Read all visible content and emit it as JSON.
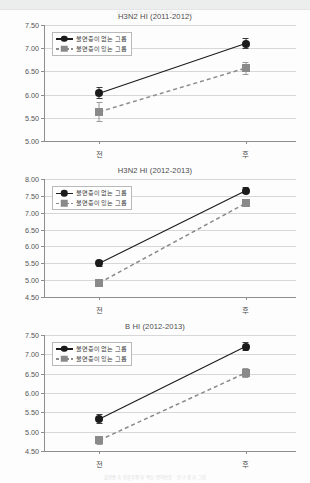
{
  "page": {
    "header_ghost_text": "대한수면의학회지 제21권 제2호 2014",
    "footer_ghost_text": "불면증과 인플루엔자 백신 면역반응  ·  연구 결과 그림"
  },
  "legend": {
    "series": [
      {
        "label": "불면증이 없는 그룹",
        "marker": "circle",
        "line": "solid",
        "color": "#1b1b1b"
      },
      {
        "label": "불면증이 있는 그룹",
        "marker": "square",
        "line": "dashed",
        "color": "#8a8a8a"
      }
    ]
  },
  "chart_data": [
    {
      "type": "line",
      "title": "H3N2 HI (2011-2012)",
      "xlabel": "",
      "ylabel": "",
      "categories": [
        "전",
        "후"
      ],
      "ylim": [
        5.0,
        7.5
      ],
      "yticks": [
        "5.00",
        "5.50",
        "6.00",
        "6.50",
        "7.00",
        "7.50"
      ],
      "grid": true,
      "legend_position": "top-left",
      "series": [
        {
          "name": "불면증이 없는 그룹",
          "values": [
            6.03,
            7.1
          ],
          "errors": [
            0.13,
            0.11
          ]
        },
        {
          "name": "불면증이 있는 그룹",
          "values": [
            5.63,
            6.57
          ],
          "errors": [
            0.22,
            0.14
          ]
        }
      ]
    },
    {
      "type": "line",
      "title": "H3N2 HI (2012-2013)",
      "xlabel": "",
      "ylabel": "",
      "categories": [
        "전",
        "후"
      ],
      "ylim": [
        4.5,
        8.0
      ],
      "yticks": [
        "4.50",
        "5.00",
        "5.50",
        "6.00",
        "6.50",
        "7.00",
        "7.50",
        "8.00"
      ],
      "grid": true,
      "legend_position": "top-left",
      "series": [
        {
          "name": "불면증이 없는 그룹",
          "values": [
            5.5,
            7.65
          ],
          "errors": [
            0.11,
            0.1
          ]
        },
        {
          "name": "불면증이 있는 그룹",
          "values": [
            4.92,
            7.28
          ],
          "errors": [
            0.12,
            0.12
          ]
        }
      ]
    },
    {
      "type": "line",
      "title": "B HI (2012-2013)",
      "xlabel": "",
      "ylabel": "",
      "categories": [
        "전",
        "후"
      ],
      "ylim": [
        4.5,
        7.5
      ],
      "yticks": [
        "4.50",
        "5.00",
        "5.50",
        "6.00",
        "6.50",
        "7.00",
        "7.50"
      ],
      "grid": true,
      "legend_position": "top-left",
      "series": [
        {
          "name": "불면증이 없는 그룹",
          "values": [
            5.33,
            7.2
          ],
          "errors": [
            0.12,
            0.11
          ]
        },
        {
          "name": "불면증이 있는 그룹",
          "values": [
            4.78,
            6.52
          ],
          "errors": [
            0.12,
            0.13
          ]
        }
      ]
    }
  ]
}
